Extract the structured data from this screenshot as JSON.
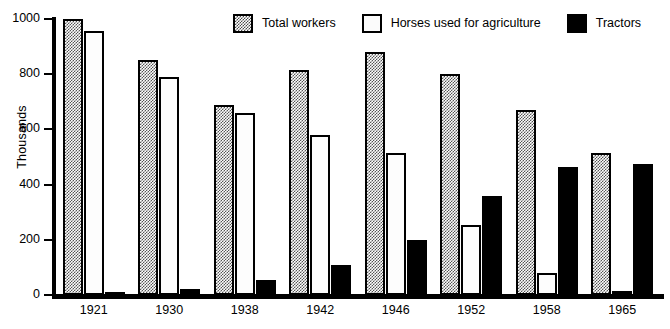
{
  "chart_data": {
    "type": "bar",
    "title": "",
    "xlabel": "",
    "ylabel": "Thousands",
    "ylim": [
      0,
      1000
    ],
    "yticks": [
      0,
      200,
      400,
      600,
      800,
      1000
    ],
    "grid": false,
    "legend_position": "top-right",
    "categories": [
      "1921",
      "1930",
      "1938",
      "1942",
      "1946",
      "1952",
      "1958",
      "1965"
    ],
    "series": [
      {
        "name": "Total workers",
        "swatch": "checker-swatch",
        "color": "#555555",
        "values": [
          1000,
          850,
          690,
          815,
          880,
          800,
          670,
          515
        ]
      },
      {
        "name": "Horses used for agriculture",
        "swatch": "white-swatch",
        "color": "#ffffff",
        "values": [
          955,
          790,
          660,
          578,
          515,
          255,
          80,
          15
        ]
      },
      {
        "name": "Tractors",
        "swatch": "black-swatch",
        "color": "#000000",
        "values": [
          10,
          20,
          55,
          110,
          200,
          360,
          465,
          475
        ]
      }
    ]
  }
}
